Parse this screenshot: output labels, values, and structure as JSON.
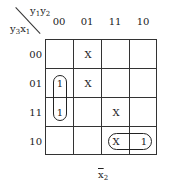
{
  "kmap": {
    "col_var_label": {
      "a": "y",
      "a_sub": "1",
      "b": "y",
      "b_sub": "2"
    },
    "row_var_label": {
      "a": "y",
      "a_sub": "3",
      "b": "x",
      "b_sub": "1"
    },
    "col_headers": [
      "00",
      "01",
      "11",
      "10"
    ],
    "row_headers": [
      "00",
      "01",
      "11",
      "10"
    ],
    "cells": [
      [
        "",
        "X",
        "",
        ""
      ],
      [
        "1",
        "X",
        "",
        ""
      ],
      [
        "1",
        "",
        "X",
        ""
      ],
      [
        "",
        "",
        "X",
        "1"
      ]
    ],
    "groups": [
      {
        "cells": "rows 01-11, col 00"
      },
      {
        "cells": "row 10, cols 11-10"
      }
    ],
    "bottom_label": {
      "var": "x",
      "sub": "2",
      "overbar": true
    }
  }
}
